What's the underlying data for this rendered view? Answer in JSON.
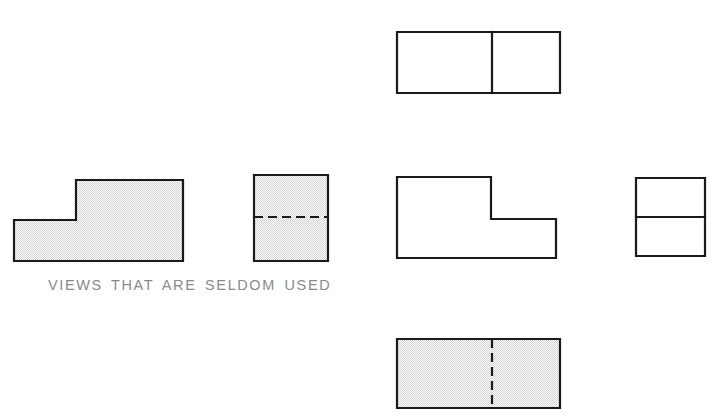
{
  "page": {
    "background_color": "#ffffff",
    "width": 712,
    "height": 415
  },
  "style": {
    "line_color": "#1a1a1a",
    "shading_color": "#e8e8e8",
    "caption_color": "#8a8a8a",
    "line_width": 2.2,
    "hidden_line_dash": "9 5"
  },
  "caption": {
    "text": "VIEWS THAT ARE SELDOM USED",
    "x": 48,
    "y": 278
  },
  "views": [
    {
      "id": "rear-view",
      "label": "rear-view",
      "group": "seldom-used",
      "shape": "l-shape-step-left",
      "shaded": true,
      "points": "14,220 76,220 76,180 183,180 183,261 14,261",
      "bounds": {
        "x": 14,
        "y": 180,
        "width": 169,
        "height": 81
      },
      "dividers": []
    },
    {
      "id": "left-side-view",
      "label": "left-side-view",
      "group": "seldom-used",
      "shape": "rectangle",
      "shaded": true,
      "points": "254,175 328,175 328,261 254,261",
      "bounds": {
        "x": 254,
        "y": 175,
        "width": 74,
        "height": 86
      },
      "dividers": [
        {
          "id": "left-side-view-hidden-divider",
          "type": "hidden",
          "orientation": "horizontal",
          "x1": 254,
          "y1": 217,
          "x2": 328,
          "y2": 217
        }
      ]
    },
    {
      "id": "top-view",
      "label": "top-view",
      "group": "standard",
      "shape": "rectangle",
      "shaded": false,
      "points": "397,32 560,32 560,93 397,93",
      "bounds": {
        "x": 397,
        "y": 32,
        "width": 163,
        "height": 61
      },
      "dividers": [
        {
          "id": "top-view-solid-divider",
          "type": "solid",
          "orientation": "vertical",
          "x1": 492,
          "y1": 32,
          "x2": 492,
          "y2": 93
        }
      ]
    },
    {
      "id": "front-view",
      "label": "front-view",
      "group": "standard",
      "shape": "l-shape-step-right",
      "shaded": false,
      "points": "397,177 491,177 491,219 556,219 556,258 397,258",
      "bounds": {
        "x": 397,
        "y": 177,
        "width": 159,
        "height": 81
      },
      "dividers": []
    },
    {
      "id": "right-side-view",
      "label": "right-side-view",
      "group": "standard",
      "shape": "rectangle",
      "shaded": false,
      "points": "636,178 705,178 705,256 636,256",
      "bounds": {
        "x": 636,
        "y": 178,
        "width": 69,
        "height": 78
      },
      "dividers": [
        {
          "id": "right-side-view-solid-divider",
          "type": "solid",
          "orientation": "horizontal",
          "x1": 636,
          "y1": 217,
          "x2": 705,
          "y2": 217
        }
      ]
    },
    {
      "id": "bottom-view",
      "label": "bottom-view",
      "group": "seldom-used",
      "shape": "rectangle",
      "shaded": true,
      "points": "397,339 560,339 560,408 397,408",
      "bounds": {
        "x": 397,
        "y": 339,
        "width": 163,
        "height": 69
      },
      "dividers": [
        {
          "id": "bottom-view-hidden-divider",
          "type": "hidden",
          "orientation": "vertical",
          "x1": 492,
          "y1": 339,
          "x2": 492,
          "y2": 408
        }
      ]
    }
  ]
}
